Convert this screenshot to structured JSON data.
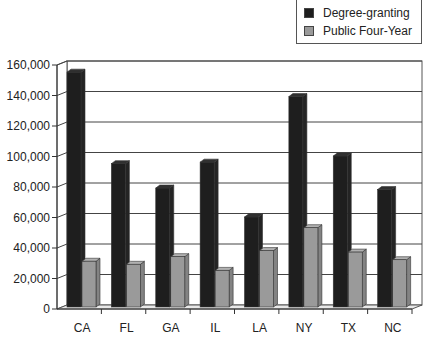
{
  "chart_data": {
    "type": "bar",
    "title": "",
    "xlabel": "",
    "ylabel": "",
    "categories": [
      "CA",
      "FL",
      "GA",
      "IL",
      "LA",
      "NY",
      "TX",
      "NC"
    ],
    "series": [
      {
        "name": "Degree-granting",
        "color": "#1e1e1e",
        "values": [
          154000,
          94000,
          78000,
          95000,
          59000,
          138000,
          99000,
          77000
        ]
      },
      {
        "name": "Public Four-Year",
        "color": "#9a9a9a",
        "values": [
          30000,
          28000,
          33000,
          24000,
          37000,
          52000,
          36000,
          31000
        ]
      }
    ],
    "ylim": [
      0,
      160000
    ],
    "yticks": [
      0,
      20000,
      40000,
      60000,
      80000,
      100000,
      120000,
      140000,
      160000
    ],
    "ytick_labels": [
      "0",
      "20,000",
      "40,000",
      "60,000",
      "80,000",
      "100,000",
      "120,000",
      "140,000",
      "160,000"
    ],
    "grid": true,
    "legend_position": "top-right",
    "style": "3d-column"
  },
  "legend": {
    "items": [
      {
        "label": "Degree-granting",
        "color": "#1e1e1e"
      },
      {
        "label": "Public Four-Year",
        "color": "#9a9a9a"
      }
    ]
  }
}
